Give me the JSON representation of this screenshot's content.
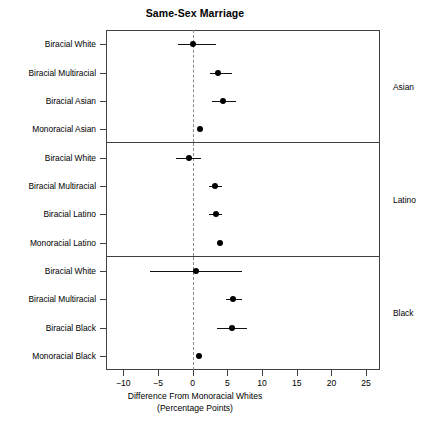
{
  "chart_data": {
    "type": "scatter",
    "title": "Same-Sex Marriage",
    "xlabel_line1": "Difference From Monoracial Whites",
    "xlabel_line2": "(Percentage Points)",
    "ylabel": "",
    "xlim": [
      -12.5,
      27.0
    ],
    "xticks": [
      -10,
      -5,
      0,
      5,
      10,
      15,
      20,
      25
    ],
    "xticklabels": [
      "−10",
      "−5",
      "0",
      "5",
      "10",
      "15",
      "20",
      "25"
    ],
    "grid": false,
    "reference_line": 0,
    "legend": "none",
    "units": "percentage points",
    "panel_label_position": "right",
    "panels": [
      {
        "name": "Asian",
        "points": [
          {
            "label": "Biracial White",
            "value": 0.0,
            "ci_low": -2.1,
            "ci_high": 3.3
          },
          {
            "label": "Biracial Multiracial",
            "value": 3.6,
            "ci_low": 2.5,
            "ci_high": 5.6
          },
          {
            "label": "Biracial Asian",
            "value": 4.3,
            "ci_low": 2.8,
            "ci_high": 6.3
          },
          {
            "label": "Monoracial Asian",
            "value": 1.1,
            "ci_low": 0.8,
            "ci_high": 1.4
          }
        ]
      },
      {
        "name": "Latino",
        "points": [
          {
            "label": "Biracial White",
            "value": -0.6,
            "ci_low": -2.4,
            "ci_high": 1.2
          },
          {
            "label": "Biracial Multiracial",
            "value": 3.2,
            "ci_low": 2.3,
            "ci_high": 4.2
          },
          {
            "label": "Biracial Latino",
            "value": 3.3,
            "ci_low": 2.4,
            "ci_high": 4.2
          },
          {
            "label": "Monoracial Latino",
            "value": 4.0,
            "ci_low": 3.8,
            "ci_high": 4.2
          }
        ]
      },
      {
        "name": "Black",
        "points": [
          {
            "label": "Biracial White",
            "value": 0.5,
            "ci_low": -6.2,
            "ci_high": 7.1
          },
          {
            "label": "Biracial Multiracial",
            "value": 5.8,
            "ci_low": 4.8,
            "ci_high": 7.1
          },
          {
            "label": "Biracial Black",
            "value": 5.6,
            "ci_low": 3.5,
            "ci_high": 7.8
          },
          {
            "label": "Monoracial Black",
            "value": 0.9,
            "ci_low": 0.7,
            "ci_high": 1.1
          }
        ]
      }
    ]
  },
  "colors": {
    "point": "#000000",
    "interval": "#111111",
    "frame": "#404040",
    "reference": "#8a8a8a",
    "background": "#ffffff"
  }
}
